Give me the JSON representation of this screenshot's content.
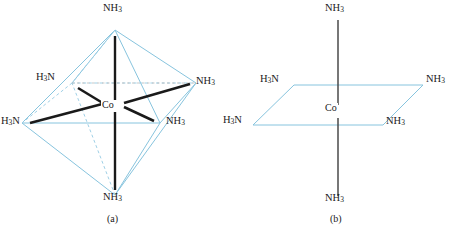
{
  "figure": {
    "colors": {
      "edge_light_blue": "#87c4de",
      "bond_black": "#1a1a1a",
      "hidden_edge_dashed": "#9fd0e6",
      "text": "#1a1a1a",
      "background": "#ffffff"
    },
    "panels": [
      {
        "id": "a",
        "caption": "(a)",
        "style": "octahedron",
        "center_label": "Co",
        "ligands": [
          {
            "position": "top",
            "label_html": "NH<sub>3</sub>",
            "label": "NH3"
          },
          {
            "position": "left-rear",
            "label_html": "H<sub>3</sub>N",
            "label": "H3N"
          },
          {
            "position": "left-front",
            "label_html": "H<sub>3</sub>N",
            "label": "H3N"
          },
          {
            "position": "right-rear",
            "label_html": "NH<sub>3</sub>",
            "label": "NH3"
          },
          {
            "position": "right-front",
            "label_html": "NH<sub>3</sub>",
            "label": "NH3"
          },
          {
            "position": "bottom",
            "label_html": "NH<sub>3</sub>",
            "label": "NH3"
          }
        ]
      },
      {
        "id": "b",
        "caption": "(b)",
        "style": "square-plane-with-axial-bonds",
        "center_label": "Co",
        "ligands": [
          {
            "position": "top",
            "label_html": "NH<sub>3</sub>",
            "label": "NH3"
          },
          {
            "position": "left-rear",
            "label_html": "H<sub>3</sub>N",
            "label": "H3N"
          },
          {
            "position": "left-front",
            "label_html": "H<sub>3</sub>N",
            "label": "H3N"
          },
          {
            "position": "right-rear",
            "label_html": "NH<sub>3</sub>",
            "label": "NH3"
          },
          {
            "position": "right-front",
            "label_html": "NH<sub>3</sub>",
            "label": "NH3"
          },
          {
            "position": "bottom",
            "label_html": "NH<sub>3</sub>",
            "label": "NH3"
          }
        ]
      }
    ]
  }
}
